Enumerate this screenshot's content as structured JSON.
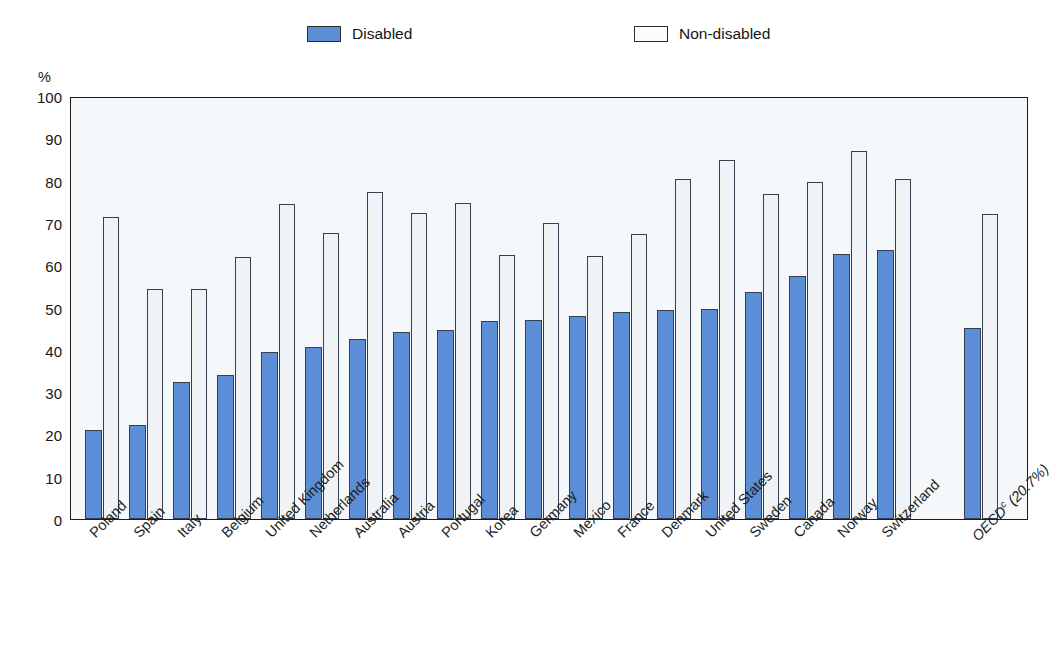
{
  "legend": {
    "items": [
      {
        "label": "Disabled",
        "color": "#5b8ed6",
        "name": "legend-disabled"
      },
      {
        "label": "Non-disabled",
        "color": "#fbfcfd",
        "name": "legend-non-disabled"
      }
    ]
  },
  "axis": {
    "y_unit": "%",
    "y_ticks": [
      "100",
      "90",
      "80",
      "70",
      "60",
      "50",
      "40",
      "30",
      "20",
      "10",
      "0"
    ]
  },
  "chart_data": {
    "type": "bar",
    "title": "",
    "subtitle": "",
    "xlabel": "",
    "ylabel": "%",
    "ylim": [
      0,
      100
    ],
    "ytick_step": 10,
    "grid": false,
    "legend_position": "top",
    "categories": [
      "Poland",
      "Spain",
      "Italy",
      "Belgium",
      "United Kingdom",
      "Netherlands",
      "Australia",
      "Austria",
      "Portugal",
      "Korea",
      "Germany",
      "Mexico",
      "France",
      "Denmark",
      "United States",
      "Sweden",
      "Canada",
      "Norway",
      "Switzerland",
      "OECD"
    ],
    "category_labels": [
      "Poland",
      "Spain",
      "Italy",
      "Belgium",
      "United Kingdom",
      "Netherlands",
      "Australia",
      "Austria",
      "Portugal",
      "Korea",
      "Germany",
      "Mexico",
      "France",
      "Denmark",
      "United States",
      "Sweden",
      "Canada",
      "Norway",
      "Switzerland",
      "OECD<sup>c</sup> (20.7%)"
    ],
    "series": [
      {
        "name": "Disabled",
        "color": "#5b8ed6",
        "values": [
          21.0,
          22.2,
          32.5,
          34.0,
          39.4,
          40.7,
          42.5,
          44.2,
          44.6,
          46.7,
          47.0,
          48.1,
          48.9,
          49.3,
          49.6,
          53.6,
          57.5,
          62.7,
          63.5,
          45.2
        ]
      },
      {
        "name": "Non-disabled",
        "color": "#f0f3f5",
        "values": [
          71.5,
          54.4,
          54.3,
          62.0,
          74.4,
          67.5,
          77.2,
          72.4,
          74.8,
          62.4,
          69.9,
          62.1,
          67.4,
          80.4,
          84.8,
          76.9,
          79.6,
          87.0,
          80.4,
          72.0
        ]
      }
    ],
    "oecd_footnote_marker": "c",
    "oecd_value_in_label": "20.7%",
    "separated_last_group": true
  }
}
